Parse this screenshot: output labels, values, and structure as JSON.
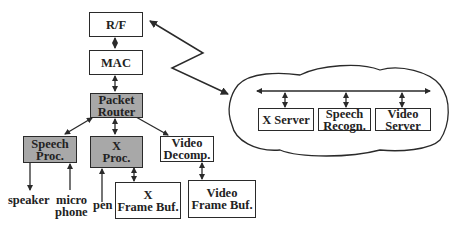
{
  "diagram": {
    "nodes": {
      "rf": {
        "line1": "R/F",
        "line2": ""
      },
      "mac": {
        "line1": "MAC",
        "line2": ""
      },
      "packet_router": {
        "line1": "Packet",
        "line2": "Router"
      },
      "speech_proc": {
        "line1": "Speech",
        "line2": "Proc."
      },
      "x_proc": {
        "line1": "X",
        "line2": "Proc."
      },
      "video_decomp": {
        "line1": "Video",
        "line2": "Decomp."
      },
      "x_frame_buf": {
        "line1": "X",
        "line2": "Frame Buf."
      },
      "video_frame_buf": {
        "line1": "Video",
        "line2": "Frame Buf."
      },
      "x_server": {
        "line1": "X Server",
        "line2": ""
      },
      "speech_recogn": {
        "line1": "Speech",
        "line2": "Recogn."
      },
      "video_server": {
        "line1": "Video",
        "line2": "Server"
      }
    },
    "io_labels": {
      "speaker": "speaker",
      "microphone_1": "micro",
      "microphone_2": "phone",
      "pen": "pen"
    },
    "colors": {
      "shaded": "#a8a8a8",
      "line": "#2a2a2a"
    }
  }
}
